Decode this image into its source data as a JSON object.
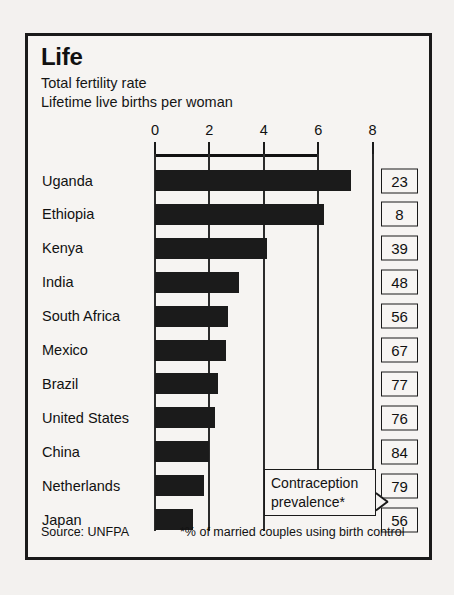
{
  "chart_data": {
    "type": "bar",
    "orientation": "horizontal",
    "title": "Life",
    "subtitle_lines": [
      "Total fertility rate",
      "Lifetime live births per woman"
    ],
    "xlabel": "",
    "ylabel": "",
    "xlim": [
      0,
      8
    ],
    "xticks": [
      0,
      2,
      4,
      6,
      8
    ],
    "xtick_labels": [
      "0",
      "2",
      "4",
      "6",
      "8"
    ],
    "grid": true,
    "legend": "none",
    "categories": [
      "Uganda",
      "Ethiopia",
      "Kenya",
      "India",
      "South Africa",
      "Mexico",
      "Brazil",
      "United States",
      "China",
      "Netherlands",
      "Japan"
    ],
    "values": [
      7.2,
      6.2,
      4.1,
      3.1,
      2.7,
      2.6,
      2.3,
      2.2,
      2.0,
      1.8,
      1.4
    ],
    "series": [
      {
        "name": "Total fertility rate",
        "values": [
          7.2,
          6.2,
          4.1,
          3.1,
          2.7,
          2.6,
          2.3,
          2.2,
          2.0,
          1.8,
          1.4
        ]
      },
      {
        "name": "Contraception prevalence*",
        "values": [
          23,
          8,
          39,
          48,
          56,
          67,
          77,
          76,
          84,
          79,
          56
        ]
      }
    ],
    "annotations": {
      "callout_line1": "Contraception",
      "callout_line2": "prevalence*",
      "source": "Source: UNFPA",
      "footnote": "*% of married couples using birth control"
    },
    "bar_color": "#1b1b1b"
  },
  "rows": [
    {
      "country": "Uganda",
      "fertility": 7.2,
      "contraception": "23"
    },
    {
      "country": "Ethiopia",
      "fertility": 6.2,
      "contraception": "8"
    },
    {
      "country": "Kenya",
      "fertility": 4.1,
      "contraception": "39"
    },
    {
      "country": "India",
      "fertility": 3.1,
      "contraception": "48"
    },
    {
      "country": "South Africa",
      "fertility": 2.7,
      "contraception": "56"
    },
    {
      "country": "Mexico",
      "fertility": 2.6,
      "contraception": "67"
    },
    {
      "country": "Brazil",
      "fertility": 2.3,
      "contraception": "77"
    },
    {
      "country": "United States",
      "fertility": 2.2,
      "contraception": "76"
    },
    {
      "country": "China",
      "fertility": 2.0,
      "contraception": "84"
    },
    {
      "country": "Netherlands",
      "fertility": 1.8,
      "contraception": "79"
    },
    {
      "country": "Japan",
      "fertility": 1.4,
      "contraception": "56"
    }
  ],
  "header": {
    "title": "Life",
    "subtitle_1": "Total fertility rate",
    "subtitle_2": "Lifetime live births per woman"
  },
  "axis": {
    "ticks": [
      "0",
      "2",
      "4",
      "6",
      "8"
    ]
  },
  "callout": {
    "line1": "Contraception",
    "line2": "prevalence*"
  },
  "footer": {
    "source": "Source: UNFPA",
    "footnote": "*% of married couples using birth control"
  },
  "colors": {
    "bar": "#1b1b1b",
    "frame": "#1a1a1a",
    "paper": "#f6f4f2",
    "page": "#f3f1ef"
  }
}
